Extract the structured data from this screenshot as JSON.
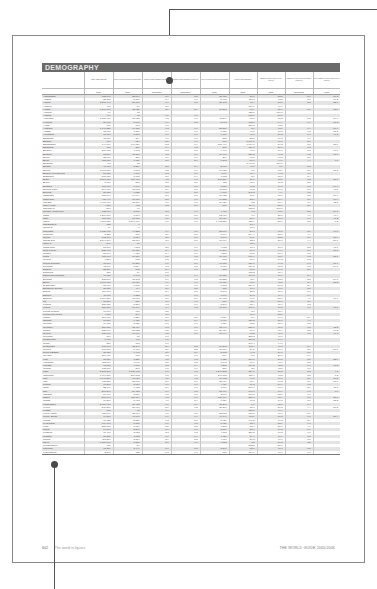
{
  "section_title": "DEMOGRAPHY",
  "columns": [
    {
      "label": "",
      "year": ""
    },
    {
      "label": "AREA (SQUARE KM)",
      "year": "2002"
    },
    {
      "label": "TOTAL POPULATION (THOUSANDS)",
      "year": "2003"
    },
    {
      "label": "POPULATION GROWTH RATE (%)",
      "year": "1990-2003"
    },
    {
      "label": "POPULATION GROWTH RATE (%)",
      "year": "2003-2015"
    },
    {
      "label": "TOTAL POPULATION (THOUSANDS)",
      "year": "2015"
    },
    {
      "label": "POPULATION DENSITY",
      "year": "2003"
    },
    {
      "label": "URBAN POPULATION (% OF TOTAL)",
      "year": "2003"
    },
    {
      "label": "URBAN POPULATION GROWTH RATE (%)",
      "year": "2000-2005"
    },
    {
      "label": "CITY URBAN POPULATION (% OF TOTAL)",
      "year": "2003"
    }
  ],
  "rows": [
    [
      "Afghanistan",
      "652,090",
      "23,897",
      "3.7",
      "3.5",
      "35,453",
      "36.6",
      "23.3",
      "5.7",
      "39.3"
    ],
    [
      "Albania",
      "28,750",
      "3,166",
      "-0.4",
      "0.7",
      "3,488",
      "110.0",
      "43.8",
      "2.1",
      "17.2"
    ],
    [
      "Algeria",
      "2,381,740",
      "31,800",
      "1.9",
      "1.5",
      "38,142",
      "13.4",
      "58.8",
      "2.5",
      "22.0"
    ],
    [
      "Andorra",
      "470",
      "71",
      "3.1",
      "",
      "",
      "151.1",
      "91.7",
      "",
      "",
      ""
    ],
    [
      "Angola",
      "1,246,700",
      "13,625",
      "2.9",
      "2.9",
      "19,268",
      "10.9",
      "35.7",
      "5.1",
      "63.0"
    ],
    [
      "Anguilla",
      "96",
      "12",
      "",
      "",
      "",
      "125.0",
      "100.0",
      "",
      ""
    ],
    [
      "Antigua",
      "440",
      "73",
      "0.6",
      "0.6",
      "",
      "165.9",
      "37.7",
      "",
      ""
    ],
    [
      "Argentina",
      "2,780,400",
      "38,428",
      "1.3",
      "1.0",
      "43,349",
      "13.8",
      "88.3",
      "1.2",
      "39.9"
    ],
    [
      "Armenia",
      "29,800",
      "3,061",
      "-0.9",
      "-0.2",
      "2,993",
      "102.7",
      "64.4",
      "-0.4",
      "51.3"
    ],
    [
      "Aruba",
      "190",
      "100",
      "1.8",
      "",
      "",
      "526.3",
      "45.5",
      "",
      ""
    ],
    [
      "Australia",
      "7,741,220",
      "19,731",
      "1.2",
      "0.9",
      "21,557",
      "2.6",
      "92.0",
      "1.4",
      "58.9"
    ],
    [
      "Austria",
      "83,860",
      "8,116",
      "0.4",
      "0.0",
      "8,131",
      "96.8",
      "65.8",
      "0.2",
      "31.3"
    ],
    [
      "Azerbaijan",
      "86,600",
      "8,370",
      "1.1",
      "0.9",
      "9,186",
      "96.6",
      "50.2",
      "0.9",
      "46.2"
    ],
    [
      "Bahamas",
      "13,880",
      "314",
      "1.7",
      "1.0",
      "352",
      "22.6",
      "89.5",
      "1.4",
      ""
    ],
    [
      "Bahrain",
      "710",
      "724",
      "2.5",
      "1.6",
      "868",
      "1,019.7",
      "90.0",
      "2.1",
      ""
    ],
    [
      "Bangladesh",
      "144,000",
      "146,736",
      "2.2",
      "1.9",
      "181,449",
      "1,019.0",
      "24.2",
      "3.6",
      "35.6"
    ],
    [
      "Barbados",
      "430",
      "270",
      "0.4",
      "0.3",
      "280",
      "627.9",
      "51.7",
      "1.5",
      ""
    ],
    [
      "Belarus",
      "207,600",
      "9,895",
      "-0.2",
      "-0.5",
      "9,498",
      "47.7",
      "70.9",
      "0.3",
      "17.7"
    ],
    [
      "Belgium",
      "30,510",
      "10,318",
      "0.3",
      "0.1",
      "10,484",
      "338.2",
      "97.2",
      "0.2",
      "11.7"
    ],
    [
      "Belize",
      "22,960",
      "256",
      "2.6",
      "1.9",
      "309",
      "11.1",
      "48.3",
      "2.0",
      ""
    ],
    [
      "Benin",
      "112,620",
      "6,736",
      "3.1",
      "2.6",
      "9,393",
      "59.8",
      "44.6",
      "4.4",
      "0.0"
    ],
    [
      "Bermuda",
      "50",
      "82",
      "",
      "",
      "",
      "1,640.0",
      "100.0",
      "",
      ""
    ],
    [
      "Bhutan",
      "47,000",
      "2,257",
      "2.5",
      "2.4",
      "2,970",
      "48.0",
      "8.9",
      "5.3",
      ""
    ],
    [
      "Bolivia",
      "1,098,580",
      "8,808",
      "2.2",
      "1.9",
      "10,811",
      "8.0",
      "63.9",
      "2.9",
      "31.2"
    ],
    [
      "Bosnia-Herzegovina",
      "51,130",
      "4,161",
      "-0.3",
      "0.1",
      "4,149",
      "81.4",
      "44.3",
      "1.9",
      ""
    ],
    [
      "Botswana",
      "581,730",
      "1,785",
      "2.0",
      "-0.4",
      "1,653",
      "3.1",
      "51.6",
      "2.4",
      ""
    ],
    [
      "Brazil",
      "8,514,880",
      "178,470",
      "1.5",
      "1.1",
      "201,359",
      "21.0",
      "83.1",
      "2.2",
      "27.7"
    ],
    [
      "Brunei",
      "5,770",
      "358",
      "2.5",
      "2.0",
      "453",
      "62.0",
      "76.2",
      "3.0",
      ""
    ],
    [
      "Bulgaria",
      "110,910",
      "7,897",
      "-0.8",
      "-0.8",
      "7,158",
      "71.2",
      "69.8",
      "-0.3",
      "16.4"
    ],
    [
      "Burkina Faso",
      "274,000",
      "13,002",
      "2.9",
      "2.8",
      "18,512",
      "47.5",
      "17.8",
      "5.1",
      "41.1"
    ],
    [
      "Burundi",
      "27,830",
      "6,825",
      "1.6",
      "3.0",
      "9,810",
      "245.2",
      "9.9",
      "6.5",
      ""
    ],
    [
      "Cambodia",
      "181,040",
      "14,144",
      "2.8",
      "2.0",
      "18,433",
      "78.1",
      "18.6",
      "5.5",
      "58.4"
    ],
    [
      "Cameroon",
      "475,440",
      "16,018",
      "2.5",
      "1.8",
      "19,232",
      "33.7",
      "51.4",
      "3.6",
      "18.4"
    ],
    [
      "Canada",
      "9,970,610",
      "31,510",
      "1.0",
      "0.8",
      "34,629",
      "3.2",
      "80.4",
      "0.9",
      "62.3"
    ],
    [
      "Cape Verde",
      "4,030",
      "463",
      "2.3",
      "2.1",
      "566",
      "114.9",
      "55.9",
      "3.6",
      ""
    ],
    [
      "Cayman Is.",
      "260",
      "40",
      "",
      "",
      "",
      "153.8",
      "100.0",
      "",
      ""
    ],
    [
      "Central African Rep.",
      "622,980",
      "3,865",
      "2.2",
      "1.6",
      "4,470",
      "6.2",
      "42.7",
      "2.5",
      "54.7"
    ],
    [
      "Chad",
      "1,284,000",
      "8,598",
      "3.1",
      "3.0",
      "12,416",
      "6.7",
      "25.0",
      "4.6",
      "47.4"
    ],
    [
      "Chile",
      "756,630",
      "15,805",
      "1.5",
      "1.1",
      "17,924",
      "20.9",
      "87.0",
      "1.6",
      "41.2"
    ],
    [
      "China",
      "9,598,050",
      "1,304,196",
      "1.0",
      "0.6",
      "1,402,321",
      "135.9",
      "38.6",
      "3.2",
      "0.3"
    ],
    [
      "Christmas Is.",
      "135",
      "1",
      "",
      "",
      "",
      "10.4",
      "",
      "",
      ""
    ],
    [
      "Cocos Is.",
      "14",
      "1",
      "",
      "",
      "",
      "45.7",
      "",
      "",
      ""
    ],
    [
      "Colombia",
      "1,138,910",
      "44,222",
      "1.9",
      "1.5",
      "52,160",
      "38.8",
      "76.5",
      "2.1",
      "16.8"
    ],
    [
      "Comoros",
      "2,230",
      "768",
      "2.9",
      "2.7",
      "1,040",
      "344.4",
      "35.0",
      "4.4",
      ""
    ],
    [
      "Congo",
      "342,000",
      "3,724",
      "3.0",
      "3.0",
      "5,198",
      "10.9",
      "53.5",
      "3.4",
      "58.4"
    ],
    [
      "Congo D.R.",
      "2,344,860",
      "52,771",
      "3.0",
      "3.0",
      "77,999",
      "22.5",
      "31.6",
      "4.4",
      "20.7"
    ],
    [
      "Cook Is.",
      "240",
      "18",
      "",
      "",
      "",
      "75.0",
      "",
      "",
      ""
    ],
    [
      "Costa Rica",
      "51,100",
      "4,173",
      "2.5",
      "1.6",
      "4,983",
      "81.7",
      "60.6",
      "2.5",
      "45.8"
    ],
    [
      "Côte d'Ivoire",
      "322,460",
      "16,631",
      "2.4",
      "1.6",
      "19,854",
      "51.6",
      "44.9",
      "2.7",
      "37.5"
    ],
    [
      "Croatia",
      "56,540",
      "4,428",
      "-0.4",
      "-0.1",
      "4,350",
      "78.3",
      "59.0",
      "0.5",
      ""
    ],
    [
      "Cuba",
      "110,860",
      "11,300",
      "0.5",
      "0.2",
      "11,480",
      "101.9",
      "75.7",
      "0.3",
      "25.1"
    ],
    [
      "Cyprus",
      "9,250",
      "802",
      "1.5",
      "1.0",
      "875",
      "86.7",
      "69.2",
      "1.3",
      ""
    ],
    [
      "Czech Republic",
      "78,870",
      "10,236",
      "0.0",
      "-0.1",
      "10,011",
      "129.8",
      "74.2",
      "-0.1",
      "15.4"
    ],
    [
      "Denmark",
      "43,090",
      "5,364",
      "0.3",
      "0.2",
      "5,457",
      "124.5",
      "85.3",
      "0.3",
      "24.5"
    ],
    [
      "Djibouti",
      "23,200",
      "703",
      "2.4",
      "1.5",
      "816",
      "30.3",
      "84.0",
      "2.0",
      ""
    ],
    [
      "Dominica",
      "750",
      "79",
      "0.0",
      "",
      "",
      "105.3",
      "71.4",
      "",
      ""
    ],
    [
      "Dominican Republic",
      "48,730",
      "8,745",
      "1.8",
      "1.4",
      "10,121",
      "179.5",
      "66.7",
      "2.4",
      ""
    ],
    [
      "Ecuador",
      "283,560",
      "13,003",
      "1.9",
      "1.3",
      "15,232",
      "45.9",
      "62.8",
      "2.2",
      "24.1"
    ],
    [
      "Egypt",
      "1,001,450",
      "71,931",
      "1.9",
      "1.7",
      "90,011",
      "71.8",
      "42.1",
      "2.4",
      "35.3"
    ],
    [
      "El Salvador",
      "21,040",
      "6,515",
      "1.9",
      "1.6",
      "7,813",
      "309.6",
      "59.2",
      "2.4",
      ""
    ],
    [
      "Equatorial Guinea",
      "28,050",
      "494",
      "2.6",
      "2.5",
      "658",
      "17.6",
      "48.1",
      "5.5",
      ""
    ],
    [
      "Eritrea",
      "117,600",
      "4,141",
      "2.4",
      "3.0",
      "5,890",
      "35.2",
      "19.1",
      "5.6",
      ""
    ],
    [
      "Estonia",
      "45,100",
      "1,323",
      "-1.1",
      "-1.0",
      "1,191",
      "29.3",
      "69.4",
      "-0.4",
      ""
    ],
    [
      "Ethiopia",
      "1,104,300",
      "70,678",
      "2.6",
      "2.4",
      "89,672",
      "64.0",
      "15.7",
      "4.0",
      "16.6"
    ],
    [
      "Fiji",
      "18,270",
      "839",
      "1.0",
      "1.0",
      "877",
      "45.9",
      "51.7",
      "2.6",
      ""
    ],
    [
      "Finland",
      "338,150",
      "5,207",
      "0.3",
      "0.1",
      "5,340",
      "15.4",
      "60.9",
      "0.3",
      ""
    ],
    [
      "France",
      "551,500",
      "60,144",
      "0.4",
      "0.3",
      "61,866",
      "109.1",
      "76.3",
      "0.6",
      "16.0"
    ],
    [
      "French Guiana",
      "90,000",
      "178",
      "3.5",
      "",
      "",
      "2.0",
      "75.4",
      "",
      ""
    ],
    [
      "French Polynesia",
      "4,000",
      "244",
      "1.8",
      "",
      "",
      "61.0",
      "52.0",
      "",
      ""
    ],
    [
      "Gabon",
      "267,670",
      "1,329",
      "2.6",
      "2.1",
      "1,659",
      "5.0",
      "84.1",
      "2.9",
      ""
    ],
    [
      "Gambia",
      "11,300",
      "1,426",
      "3.4",
      "2.4",
      "1,979",
      "126.2",
      "26.1",
      "4.6",
      ""
    ],
    [
      "Georgia",
      "69,700",
      "5,126",
      "-1.1",
      "-0.7",
      "4,739",
      "73.5",
      "56.9",
      "-0.5",
      ""
    ],
    [
      "Germany",
      "357,030",
      "82,476",
      "0.3",
      "0.0",
      "82,497",
      "231.0",
      "88.1",
      "0.2",
      "12.2"
    ],
    [
      "Ghana",
      "238,540",
      "20,922",
      "2.5",
      "1.9",
      "26,434",
      "87.7",
      "45.4",
      "3.3",
      "18.2"
    ],
    [
      "Greece",
      "131,960",
      "10,976",
      "0.5",
      "0.0",
      "10,944",
      "83.2",
      "61.0",
      "0.5",
      "41.8"
    ],
    [
      "Grenada",
      "340",
      "80",
      "0.0",
      "",
      "",
      "235.3",
      "40.6",
      "",
      ""
    ],
    [
      "Guadeloupe",
      "1,710",
      "440",
      "1.1",
      "",
      "",
      "257.3",
      "99.7",
      "",
      ""
    ],
    [
      "Guam",
      "550",
      "163",
      "1.6",
      "",
      "",
      "296.4",
      "94.1",
      "",
      ""
    ],
    [
      "Guatemala",
      "108,890",
      "12,347",
      "2.6",
      "2.5",
      "16,245",
      "113.4",
      "46.3",
      "3.4",
      ""
    ],
    [
      "Guinea",
      "245,860",
      "8,480",
      "2.9",
      "2.2",
      "10,977",
      "34.5",
      "34.9",
      "3.6",
      "50.1"
    ],
    [
      "Guinea-Bissau",
      "36,120",
      "1,493",
      "3.0",
      "2.9",
      "2,102",
      "41.3",
      "34.0",
      "5.5",
      ""
    ],
    [
      "Guyana",
      "214,970",
      "765",
      "0.3",
      "0.1",
      "774",
      "3.6",
      "37.6",
      "0.9",
      ""
    ],
    [
      "Haiti",
      "27,750",
      "8,326",
      "1.5",
      "1.3",
      "9,725",
      "300.0",
      "37.5",
      "3.3",
      "23.9"
    ],
    [
      "Honduras",
      "112,090",
      "6,941",
      "2.8",
      "2.2",
      "8,643",
      "61.9",
      "45.6",
      "3.3",
      ""
    ],
    [
      "Hungary",
      "93,030",
      "9,877",
      "-0.2",
      "-0.4",
      "9,285",
      "106.2",
      "65.2",
      "0.1",
      "18.2"
    ],
    [
      "Iceland",
      "103,000",
      "290",
      "1.0",
      "0.7",
      "317",
      "2.8",
      "92.8",
      "0.8",
      ""
    ],
    [
      "India",
      "3,287,260",
      "1,065,462",
      "1.8",
      "1.3",
      "1,246,382",
      "324.1",
      "28.3",
      "2.3",
      "4.2"
    ],
    [
      "Indonesia",
      "1,904,570",
      "219,883",
      "1.5",
      "1.1",
      "246,813",
      "115.4",
      "45.5",
      "3.3",
      "7.3"
    ],
    [
      "Iran",
      "1,648,200",
      "68,920",
      "1.5",
      "1.3",
      "79,912",
      "41.8",
      "66.7",
      "2.1",
      "18.2"
    ],
    [
      "Iraq",
      "438,320",
      "25,175",
      "2.7",
      "2.4",
      "33,419",
      "57.4",
      "67.2",
      "2.4",
      "28.0"
    ],
    [
      "Ireland",
      "70,270",
      "3,956",
      "1.0",
      "1.1",
      "4,424",
      "56.3",
      "59.9",
      "1.3",
      ""
    ],
    [
      "Israel",
      "22,140",
      "6,433",
      "2.9",
      "1.7",
      "7,606",
      "290.6",
      "91.6",
      "2.0",
      "12.7"
    ],
    [
      "Italy",
      "301,340",
      "57,423",
      "0.1",
      "-0.2",
      "55,469",
      "190.6",
      "67.4",
      "0.1",
      "8.6"
    ],
    [
      "Jamaica",
      "10,990",
      "2,651",
      "0.8",
      "0.5",
      "2,807",
      "241.2",
      "52.1",
      "1.1",
      ""
    ],
    [
      "Japan",
      "377,890",
      "127,654",
      "0.3",
      "-0.1",
      "126,714",
      "337.8",
      "65.4",
      "0.3",
      "27.0"
    ],
    [
      "Jordan",
      "89,210",
      "5,473",
      "4.1",
      "2.4",
      "7,139",
      "61.3",
      "79.1",
      "3.0",
      "22.3"
    ],
    [
      "Kazakhstan",
      "2,724,900",
      "15,433",
      "-0.6",
      "-0.1",
      "15,248",
      "5.7",
      "55.8",
      "0.4",
      ""
    ],
    [
      "Kenya",
      "580,370",
      "31,987",
      "2.6",
      "1.2",
      "37,261",
      "55.1",
      "39.3",
      "4.4",
      "20.2"
    ],
    [
      "Kiribati",
      "730",
      "88",
      "1.4",
      "",
      "",
      "120.5",
      "47.4",
      "",
      ""
    ],
    [
      "Korea, North",
      "120,540",
      "22,664",
      "1.1",
      "0.5",
      "23,813",
      "188.0",
      "61.1",
      "1.0",
      ""
    ],
    [
      "Korea, South",
      "99,260",
      "47,700",
      "0.9",
      "0.4",
      "49,747",
      "480.6",
      "80.3",
      "1.0",
      "21.4"
    ],
    [
      "Kuwait",
      "17,820",
      "2,521",
      "0.3",
      "2.6",
      "3,427",
      "141.5",
      "96.2",
      "2.9",
      ""
    ],
    [
      "Kyrgyzstan",
      "199,900",
      "5,138",
      "1.1",
      "1.2",
      "5,920",
      "25.7",
      "33.9",
      "1.0",
      ""
    ],
    [
      "Laos",
      "236,800",
      "5,657",
      "2.5",
      "2.2",
      "7,283",
      "23.9",
      "20.7",
      "4.6",
      ""
    ],
    [
      "Latvia",
      "64,600",
      "2,307",
      "-1.1",
      "-0.6",
      "2,106",
      "35.7",
      "66.3",
      "-0.6",
      ""
    ],
    [
      "Lebanon",
      "10,400",
      "3,653",
      "2.3",
      "1.2",
      "4,183",
      "351.3",
      "87.5",
      "1.6",
      ""
    ],
    [
      "Lesotho",
      "30,350",
      "1,802",
      "1.0",
      "-0.4",
      "1,720",
      "59.4",
      "17.9",
      "1.3",
      ""
    ],
    [
      "Liberia",
      "111,370",
      "3,367",
      "2.9",
      "3.2",
      "4,907",
      "30.2",
      "46.7",
      "5.5",
      ""
    ],
    [
      "Libya",
      "1,759,540",
      "5,551",
      "2.1",
      "1.8",
      "6,752",
      "3.2",
      "86.3",
      "2.2",
      ""
    ],
    [
      "Liechtenstein",
      "160",
      "34",
      "",
      "",
      "",
      "212.5",
      "21.6",
      "",
      ""
    ],
    [
      "Lithuania",
      "65,200",
      "3,444",
      "-0.6",
      "-0.5",
      "3,296",
      "52.8",
      "66.8",
      "-0.2",
      ""
    ],
    [
      "Luxembourg",
      "2,590",
      "453",
      "1.3",
      "1.1",
      "515",
      "174.9",
      "91.9",
      "1.7",
      ""
    ]
  ],
  "footer": {
    "page_number": "602",
    "section_name": "The world in figures",
    "book_title": "THE WORLD GUIDE 2005/2006"
  },
  "callouts": {
    "top": {
      "dot": [
        169,
        80
      ],
      "color": "#4a4a4a"
    },
    "bottom": {
      "dot": [
        54,
        464
      ],
      "color": "#4a4a4a"
    }
  }
}
